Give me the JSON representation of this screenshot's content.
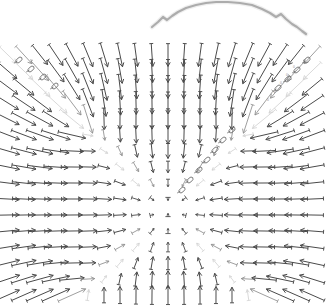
{
  "figure": {
    "title": "",
    "background_color": "#ffffff",
    "width": 328,
    "height": 307
  },
  "chart_data": {
    "type": "scatter",
    "plot_kind": "quiver-vector-field",
    "title": "",
    "subtitle": "",
    "xlabel": "",
    "ylabel": "",
    "grid": false,
    "legend": "none",
    "axes_visible": false,
    "tick_labels_x": [],
    "tick_labels_y": [],
    "xlim": [
      0,
      328
    ],
    "ylim": [
      0,
      307
    ],
    "grid_spacing_px": 16,
    "grid_origin_px": [
      8,
      55
    ],
    "grid_cols": 20,
    "grid_rows": 16,
    "singularities": [
      {
        "name": "center-sink",
        "x": 168,
        "y": 211,
        "kind": "sink"
      },
      {
        "name": "node-upper-left",
        "x": 85,
        "y": 127,
        "kind": "node"
      },
      {
        "name": "node-upper-right",
        "x": 251,
        "y": 127,
        "kind": "node"
      },
      {
        "name": "node-lower-left",
        "x": 85,
        "y": 296,
        "kind": "node"
      },
      {
        "name": "node-lower-right",
        "x": 251,
        "y": 296,
        "kind": "node"
      }
    ],
    "magnitude_scale": 13.5,
    "min_arrow_px": 3.2,
    "max_arrow_px": 30,
    "colors": {
      "arrow_dark": "#4a4a4a",
      "arrow_mid": "#8c8c8c",
      "arrow_faint": "#d2d2d2",
      "loop_glyph": "#6f6f6f",
      "arch_curve": "#9a9a9a",
      "background": "#ffffff"
    },
    "annotations": [
      {
        "name": "arch-curve",
        "kind": "polyline",
        "color": "#9a9a9a",
        "stroke_width": 2.2,
        "points": [
          [
            152,
            27
          ],
          [
            158,
            22
          ],
          [
            163,
            17
          ],
          [
            167,
            20
          ],
          [
            172,
            16
          ],
          [
            178,
            12
          ],
          [
            186,
            8
          ],
          [
            196,
            5
          ],
          [
            206,
            3
          ],
          [
            216,
            2
          ],
          [
            228,
            2
          ],
          [
            240,
            3
          ],
          [
            252,
            5
          ],
          [
            262,
            9
          ],
          [
            270,
            13
          ],
          [
            276,
            17
          ],
          [
            281,
            14
          ],
          [
            286,
            19
          ],
          [
            292,
            24
          ],
          [
            297,
            27
          ],
          [
            302,
            31
          ],
          [
            306,
            34
          ]
        ]
      },
      {
        "name": "loop-glyph-cluster-upper-left",
        "kind": "loops",
        "items": [
          [
            19,
            60
          ],
          [
            31,
            69
          ],
          [
            43,
            77
          ],
          [
            55,
            86
          ]
        ]
      },
      {
        "name": "loop-glyph-cluster-upper-right",
        "kind": "loops",
        "items": [
          [
            307,
            60
          ],
          [
            297,
            70
          ],
          [
            288,
            79
          ],
          [
            278,
            88
          ]
        ]
      },
      {
        "name": "loop-glyph-cluster-center-right",
        "kind": "loops",
        "items": [
          [
            232,
            130
          ],
          [
            223,
            140
          ],
          [
            215,
            150
          ],
          [
            207,
            160
          ],
          [
            199,
            170
          ],
          [
            190,
            180
          ],
          [
            182,
            190
          ]
        ]
      }
    ],
    "tiny_value_labels": [
      {
        "text": "0",
        "x": 294,
        "y": 68
      },
      {
        "text": "0",
        "x": 287,
        "y": 76
      },
      {
        "text": "0",
        "x": 281,
        "y": 84
      },
      {
        "text": "0",
        "x": 275,
        "y": 93
      },
      {
        "text": "0",
        "x": 268,
        "y": 101
      }
    ]
  },
  "accessibility": {
    "alt_text": "Vector field quiver plot with arrows converging toward a central point"
  }
}
